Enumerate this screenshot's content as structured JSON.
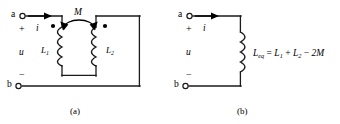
{
  "figure": {
    "panels": [
      {
        "id": "a",
        "caption": "(a)",
        "terminals": {
          "top": "a",
          "bottom": "b"
        },
        "polarity": {
          "plus": "+",
          "minus": "−"
        },
        "current_label": "i",
        "voltage_label": "u",
        "mutual_label": "M",
        "coils": [
          {
            "name": "L",
            "subscript": "1",
            "dot": "upper-left"
          },
          {
            "name": "L",
            "subscript": "2",
            "dot": "upper-right"
          }
        ]
      },
      {
        "id": "b",
        "caption": "(b)",
        "terminals": {
          "top": "a",
          "bottom": "b"
        },
        "polarity": {
          "plus": "+",
          "minus": "−"
        },
        "current_label": "i",
        "voltage_label": "u",
        "equation": {
          "lhs_name": "L",
          "lhs_subscript": "eq",
          "equals": "=",
          "term1_name": "L",
          "term1_subscript": "1",
          "op1": "+",
          "term2_name": "L",
          "term2_subscript": "2",
          "op2": "−",
          "term3": "2M"
        }
      }
    ]
  },
  "colors": {
    "background": "#ffffff",
    "wire": "#1a1a1a",
    "text": "#000000"
  }
}
